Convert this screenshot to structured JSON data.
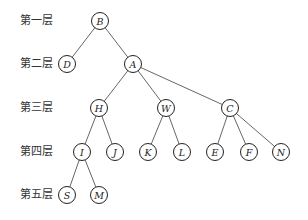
{
  "levels": [
    {
      "label": "第一层",
      "y": 21
    },
    {
      "label": "第二层",
      "y": 64
    },
    {
      "label": "第三层",
      "y": 108
    },
    {
      "label": "第四层",
      "y": 152
    },
    {
      "label": "第五层",
      "y": 195
    }
  ],
  "nodes": [
    {
      "id": "B",
      "x": 100,
      "y": 21
    },
    {
      "id": "D",
      "x": 67,
      "y": 64
    },
    {
      "id": "A",
      "x": 133,
      "y": 64
    },
    {
      "id": "H",
      "x": 99,
      "y": 108
    },
    {
      "id": "W",
      "x": 166,
      "y": 108
    },
    {
      "id": "C",
      "x": 230,
      "y": 108
    },
    {
      "id": "I",
      "x": 82,
      "y": 152
    },
    {
      "id": "J",
      "x": 115,
      "y": 152
    },
    {
      "id": "K",
      "x": 148,
      "y": 152
    },
    {
      "id": "L",
      "x": 182,
      "y": 152
    },
    {
      "id": "E",
      "x": 215,
      "y": 152
    },
    {
      "id": "F",
      "x": 249,
      "y": 152
    },
    {
      "id": "N",
      "x": 281,
      "y": 152
    },
    {
      "id": "S",
      "x": 67,
      "y": 195
    },
    {
      "id": "M",
      "x": 99,
      "y": 195
    }
  ],
  "edges": [
    [
      "B",
      "D"
    ],
    [
      "B",
      "A"
    ],
    [
      "A",
      "H"
    ],
    [
      "A",
      "W"
    ],
    [
      "A",
      "C"
    ],
    [
      "H",
      "I"
    ],
    [
      "H",
      "J"
    ],
    [
      "W",
      "K"
    ],
    [
      "W",
      "L"
    ],
    [
      "C",
      "E"
    ],
    [
      "C",
      "F"
    ],
    [
      "C",
      "N"
    ],
    [
      "I",
      "S"
    ],
    [
      "I",
      "M"
    ]
  ]
}
